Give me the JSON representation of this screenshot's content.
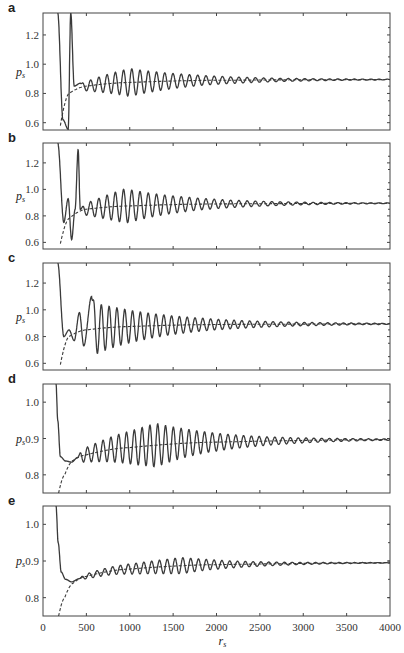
{
  "chart_data": [
    {
      "panel": "a",
      "type": "line",
      "xlabel": "r_s",
      "ylabel": "p_s",
      "xlim": [
        0,
        4000
      ],
      "ylim": [
        0.55,
        1.35
      ],
      "yticks": [
        0.6,
        0.8,
        1.0,
        1.2
      ],
      "xticks": [
        0,
        500,
        1000,
        1500,
        2000,
        2500,
        3000,
        3500,
        4000
      ],
      "asymptote": 0.895,
      "series": [
        {
          "name": "oscillating",
          "style": "solid",
          "start_x": 170,
          "start_y": 1.35,
          "key_points": [
            [
              170,
              1.35
            ],
            [
              230,
              0.62
            ],
            [
              290,
              0.555
            ],
            [
              320,
              1.35
            ],
            [
              360,
              0.85
            ],
            [
              430,
              0.87
            ]
          ],
          "osc_start": 430,
          "osc_period": 95,
          "envelope_peak_x": 1000,
          "envelope_peak_amp": 0.095,
          "decay_end": 3600
        },
        {
          "name": "mean",
          "style": "dashed",
          "points": [
            [
              200,
              0.58
            ],
            [
              300,
              0.8
            ],
            [
              500,
              0.85
            ],
            [
              1000,
              0.875
            ],
            [
              2000,
              0.89
            ],
            [
              4000,
              0.895
            ]
          ]
        }
      ]
    },
    {
      "panel": "b",
      "type": "line",
      "xlabel": "r_s",
      "ylabel": "p_s",
      "xlim": [
        0,
        4000
      ],
      "ylim": [
        0.55,
        1.35
      ],
      "yticks": [
        0.6,
        0.8,
        1.0,
        1.2
      ],
      "xticks": [
        0,
        500,
        1000,
        1500,
        2000,
        2500,
        3000,
        3500,
        4000
      ],
      "asymptote": 0.895,
      "series": [
        {
          "name": "oscillating",
          "style": "solid",
          "key_points": [
            [
              170,
              1.35
            ],
            [
              240,
              0.75
            ],
            [
              290,
              0.93
            ],
            [
              330,
              0.62
            ],
            [
              370,
              0.85
            ],
            [
              405,
              1.3
            ],
            [
              430,
              0.85
            ]
          ],
          "osc_start": 430,
          "osc_period": 95,
          "envelope_peak_x": 950,
          "envelope_peak_amp": 0.13,
          "decay_end": 3500
        },
        {
          "name": "mean",
          "style": "dashed",
          "points": [
            [
              200,
              0.59
            ],
            [
              300,
              0.78
            ],
            [
              500,
              0.85
            ],
            [
              1000,
              0.875
            ],
            [
              2000,
              0.89
            ],
            [
              4000,
              0.895
            ]
          ]
        }
      ]
    },
    {
      "panel": "c",
      "type": "line",
      "xlabel": "r_s",
      "ylabel": "p_s",
      "xlim": [
        0,
        4000
      ],
      "ylim": [
        0.55,
        1.35
      ],
      "yticks": [
        0.6,
        0.8,
        1.0,
        1.2
      ],
      "xticks": [
        0,
        500,
        1000,
        1500,
        2000,
        2500,
        3000,
        3500,
        4000
      ],
      "asymptote": 0.895,
      "series": [
        {
          "name": "oscillating",
          "style": "solid",
          "key_points": [
            [
              170,
              1.35
            ],
            [
              240,
              0.8
            ],
            [
              300,
              0.85
            ],
            [
              360,
              0.77
            ],
            [
              420,
              0.98
            ],
            [
              470,
              0.73
            ],
            [
              560,
              1.1
            ]
          ],
          "osc_start": 560,
          "osc_period": 90,
          "envelope_peak_x": 560,
          "envelope_peak_amp": 0.2,
          "decay_end": 3400
        },
        {
          "name": "mean",
          "style": "dashed",
          "points": [
            [
              200,
              0.59
            ],
            [
              300,
              0.8
            ],
            [
              500,
              0.85
            ],
            [
              1000,
              0.875
            ],
            [
              2000,
              0.89
            ],
            [
              4000,
              0.895
            ]
          ]
        }
      ]
    },
    {
      "panel": "d",
      "type": "line",
      "xlabel": "r_s",
      "ylabel": "p_s",
      "xlim": [
        0,
        4000
      ],
      "ylim": [
        0.75,
        1.05
      ],
      "yticks": [
        0.8,
        0.9,
        1.0
      ],
      "xticks": [
        0,
        500,
        1000,
        1500,
        2000,
        2500,
        3000,
        3500,
        4000
      ],
      "asymptote": 0.897,
      "series": [
        {
          "name": "oscillating",
          "style": "solid",
          "key_points": [
            [
              150,
              1.05
            ],
            [
              170,
              0.95
            ],
            [
              200,
              0.85
            ],
            [
              260,
              0.838
            ],
            [
              330,
              0.835
            ],
            [
              400,
              0.848
            ]
          ],
          "osc_start": 400,
          "osc_period": 90,
          "envelope_peak_x": 1300,
          "envelope_peak_amp": 0.06,
          "decay_end": 3800
        },
        {
          "name": "mean",
          "style": "dashed",
          "points": [
            [
              180,
              0.75
            ],
            [
              250,
              0.8
            ],
            [
              350,
              0.84
            ],
            [
              500,
              0.855
            ],
            [
              1000,
              0.875
            ],
            [
              2000,
              0.89
            ],
            [
              4000,
              0.897
            ]
          ]
        }
      ]
    },
    {
      "panel": "e",
      "type": "line",
      "xlabel": "r_s",
      "ylabel": "p_s",
      "xlim": [
        0,
        4000
      ],
      "ylim": [
        0.75,
        1.05
      ],
      "yticks": [
        0.8,
        0.9,
        1.0
      ],
      "xticks": [
        0,
        500,
        1000,
        1500,
        2000,
        2500,
        3000,
        3500,
        4000
      ],
      "xtick_labels": [
        "0",
        "500",
        "1000",
        "1500",
        "2000",
        "2500",
        "3000",
        "3500",
        "4000"
      ],
      "asymptote": 0.895,
      "series": [
        {
          "name": "oscillating",
          "style": "solid",
          "key_points": [
            [
              150,
              1.05
            ],
            [
              175,
              0.95
            ],
            [
              210,
              0.87
            ],
            [
              260,
              0.85
            ],
            [
              330,
              0.843
            ],
            [
              420,
              0.852
            ]
          ],
          "osc_start": 420,
          "osc_period": 90,
          "envelope_peak_x": 1600,
          "envelope_peak_amp": 0.022,
          "decay_end": 3800
        },
        {
          "name": "mean",
          "style": "dashed",
          "points": [
            [
              180,
              0.75
            ],
            [
              250,
              0.8
            ],
            [
              350,
              0.84
            ],
            [
              500,
              0.858
            ],
            [
              1000,
              0.878
            ],
            [
              2000,
              0.89
            ],
            [
              4000,
              0.895
            ]
          ]
        }
      ]
    }
  ],
  "panels": [
    {
      "label": "a",
      "ylabel": "p",
      "ylabel_sub": "s",
      "ytick_labels": [
        "0.6",
        "0.8",
        "1.0",
        "1.2"
      ]
    },
    {
      "label": "b",
      "ylabel": "p",
      "ylabel_sub": "s",
      "ytick_labels": [
        "0.6",
        "0.8",
        "1.0",
        "1.2"
      ]
    },
    {
      "label": "c",
      "ylabel": "p",
      "ylabel_sub": "s",
      "ytick_labels": [
        "0.6",
        "0.8",
        "1.0",
        "1.2"
      ]
    },
    {
      "label": "d",
      "ylabel": "p",
      "ylabel_sub": "s",
      "ytick_labels": [
        "0.8",
        "0.9",
        "1.0"
      ]
    },
    {
      "label": "e",
      "ylabel": "p",
      "ylabel_sub": "s",
      "ytick_labels": [
        "0.8",
        "0.9",
        "1.0"
      ]
    }
  ],
  "xaxis": {
    "label": "r",
    "label_sub": "s",
    "tick_labels": [
      "0",
      "500",
      "1000",
      "1500",
      "2000",
      "2500",
      "3000",
      "3500",
      "4000"
    ]
  }
}
